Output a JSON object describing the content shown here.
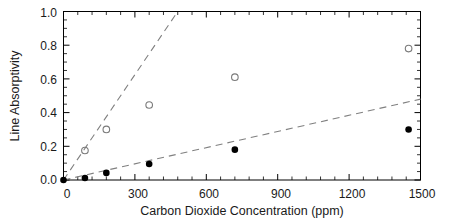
{
  "chart_data": {
    "type": "scatter",
    "title": "",
    "xlabel": "Carbon Dioxide Concentration (ppm)",
    "ylabel": "Line Absorptivity",
    "xlim": [
      0,
      1500
    ],
    "ylim": [
      0.0,
      1.0
    ],
    "xticks": [
      0,
      300,
      600,
      900,
      1200,
      1500
    ],
    "xtick_labels": [
      "0",
      "300",
      "600",
      "900",
      "1200",
      "1500"
    ],
    "yticks": [
      0.0,
      0.2,
      0.4,
      0.6,
      0.8,
      1.0
    ],
    "ytick_labels": [
      "0.0",
      "0.2",
      "0.4",
      "0.6",
      "0.8",
      "1.0"
    ],
    "x_minor_count": 5,
    "y_minor_count": 4,
    "grid": false,
    "legend": "none",
    "series": [
      {
        "name": "filled-markers",
        "marker": "filled-circle",
        "color": "#000000",
        "points": [
          {
            "x": 0,
            "y": 0.0
          },
          {
            "x": 90,
            "y": 0.012
          },
          {
            "x": 180,
            "y": 0.042
          },
          {
            "x": 360,
            "y": 0.095
          },
          {
            "x": 720,
            "y": 0.18
          },
          {
            "x": 1450,
            "y": 0.3
          }
        ]
      },
      {
        "name": "open-markers",
        "marker": "open-circle",
        "color": "#7a7a7a",
        "points": [
          {
            "x": 90,
            "y": 0.175
          },
          {
            "x": 180,
            "y": 0.3
          },
          {
            "x": 360,
            "y": 0.445
          },
          {
            "x": 720,
            "y": 0.61
          },
          {
            "x": 1450,
            "y": 0.78
          }
        ]
      }
    ],
    "trend_lines": [
      {
        "name": "steep-dashed-fit",
        "style": "dashed",
        "color": "#808080",
        "from": {
          "x": 0,
          "y": 0.0
        },
        "to": {
          "x": 480,
          "y": 1.0
        }
      },
      {
        "name": "shallow-dashed-fit",
        "style": "dashed",
        "color": "#808080",
        "from": {
          "x": 0,
          "y": 0.0
        },
        "to": {
          "x": 1500,
          "y": 0.48
        }
      }
    ]
  },
  "axes": {
    "x_title": "Carbon Dioxide Concentration (ppm)",
    "y_title": "Line Absorptivity"
  },
  "x_labels": {
    "t0": "0",
    "t1": "300",
    "t2": "600",
    "t3": "900",
    "t4": "1200",
    "t5": "1500"
  },
  "y_labels": {
    "t0": "0.0",
    "t1": "0.2",
    "t2": "0.4",
    "t3": "0.6",
    "t4": "0.8",
    "t5": "1.0"
  }
}
